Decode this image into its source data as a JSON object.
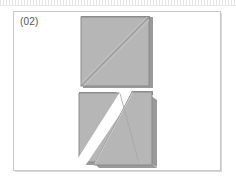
{
  "panel": {
    "caption": "(02)",
    "background_color": "#ffffff",
    "border_color": "#c9c9c9"
  },
  "figure": {
    "name": "square-diagonal-cut-diagram",
    "fill_color": "#b6b6b6",
    "edge_color": "#8f8f8f",
    "shadow_color": "#9a9a9a",
    "seam_color": "#9d9d9d",
    "gap_color": "#ffffff",
    "shapes": [
      {
        "id": "intact-square",
        "label": "square with diagonal seam",
        "outline": "square",
        "seam": "diagonal from bottom-left to top-right",
        "separated": "no"
      },
      {
        "id": "separated-square",
        "label": "square split into two triangles",
        "outline": "square",
        "seam": "diagonal from bottom-left to top-right",
        "separated": "yes",
        "pieces": [
          "lower-left-triangle",
          "upper-right-triangle"
        ]
      }
    ]
  }
}
